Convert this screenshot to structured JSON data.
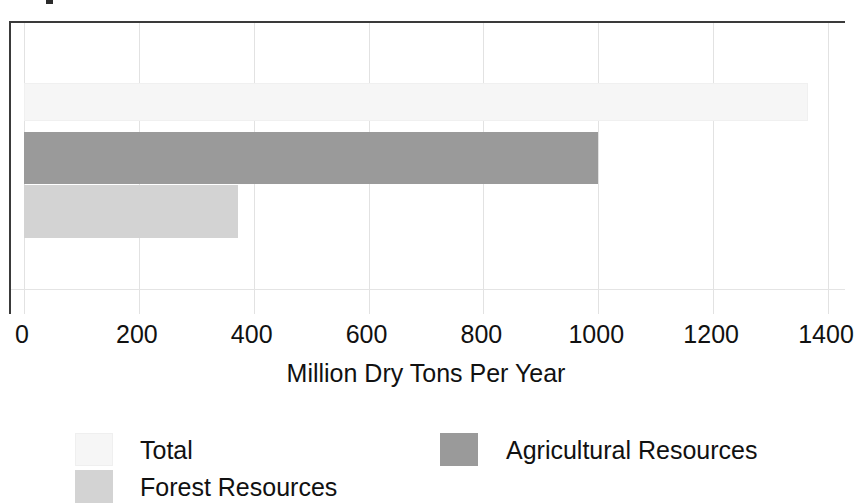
{
  "chart_data": {
    "type": "bar",
    "orientation": "horizontal",
    "title": "",
    "xlabel": "Million Dry Tons Per Year",
    "ylabel": "",
    "xlim": [
      0,
      1400
    ],
    "xticks": [
      0,
      200,
      400,
      600,
      800,
      1000,
      1200,
      1400
    ],
    "xtick_labels": [
      "0",
      "200",
      "400",
      "600",
      "800",
      "1000",
      "1200",
      "1400"
    ],
    "grid": true,
    "grid_axis": "x",
    "legend_position": "bottom",
    "categories": [
      "Total",
      "Agricultural Resources",
      "Forest Resources"
    ],
    "values": [
      1366,
      999,
      372
    ],
    "series": [
      {
        "name": "Total",
        "value": 1366,
        "color": "#f6f6f6"
      },
      {
        "name": "Agricultural Resources",
        "value": 999,
        "color": "#9a9a9a"
      },
      {
        "name": "Forest Resources",
        "value": 372,
        "color": "#d3d3d3"
      }
    ]
  },
  "axis": {
    "title": "Million Dry Tons Per Year",
    "ticks": [
      {
        "label": "0",
        "value": 0
      },
      {
        "label": "200",
        "value": 200
      },
      {
        "label": "400",
        "value": 400
      },
      {
        "label": "600",
        "value": 600
      },
      {
        "label": "800",
        "value": 800
      },
      {
        "label": "1000",
        "value": 1000
      },
      {
        "label": "1200",
        "value": 1200
      },
      {
        "label": "1400",
        "value": 1400
      }
    ]
  },
  "legend": {
    "entries": [
      {
        "label": "Total",
        "color": "#f6f6f6"
      },
      {
        "label": "Agricultural Resources",
        "color": "#9a9a9a"
      },
      {
        "label": "Forest Resources",
        "color": "#d3d3d3"
      }
    ]
  },
  "colors": {
    "total": "#f6f6f6",
    "agricultural": "#9a9a9a",
    "forest": "#d3d3d3",
    "axis": "#3a3a3a",
    "grid": "#e2e2e2",
    "text": "#111111",
    "background": "#ffffff"
  }
}
